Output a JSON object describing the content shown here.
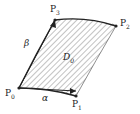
{
  "diagram": {
    "points": [
      {
        "name": "P",
        "sub": "0",
        "x": 19,
        "y": 88
      },
      {
        "name": "P",
        "sub": "1",
        "x": 76,
        "y": 96
      },
      {
        "name": "P",
        "sub": "2",
        "x": 116,
        "y": 26
      },
      {
        "name": "P",
        "sub": "3",
        "x": 55,
        "y": 20
      }
    ],
    "region_label": {
      "name": "D",
      "sub": "0"
    },
    "vectors": {
      "alpha": "α",
      "beta": "β"
    },
    "colors": {
      "stroke": "#222222",
      "hatch": "#555555"
    }
  }
}
